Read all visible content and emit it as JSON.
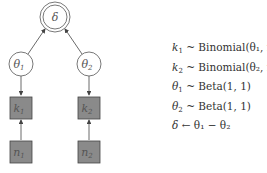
{
  "diagram": {
    "type": "graphical-model",
    "nodes": [
      {
        "id": "delta",
        "label": "δ",
        "sub": "",
        "shape": "double-circle",
        "kind": "deterministic"
      },
      {
        "id": "theta1",
        "label": "θ",
        "sub": "1",
        "shape": "circle",
        "kind": "latent"
      },
      {
        "id": "theta2",
        "label": "θ",
        "sub": "2",
        "shape": "circle",
        "kind": "latent"
      },
      {
        "id": "k1",
        "label": "k",
        "sub": "1",
        "shape": "square",
        "kind": "observed"
      },
      {
        "id": "k2",
        "label": "k",
        "sub": "2",
        "shape": "square",
        "kind": "observed"
      },
      {
        "id": "n1",
        "label": "n",
        "sub": "1",
        "shape": "square",
        "kind": "observed"
      },
      {
        "id": "n2",
        "label": "n",
        "sub": "2",
        "shape": "square",
        "kind": "observed"
      }
    ],
    "edges": [
      {
        "from": "theta1",
        "to": "delta"
      },
      {
        "from": "theta2",
        "to": "delta"
      },
      {
        "from": "theta1",
        "to": "k1"
      },
      {
        "from": "theta2",
        "to": "k2"
      },
      {
        "from": "n1",
        "to": "k1"
      },
      {
        "from": "n2",
        "to": "k2"
      }
    ],
    "colors": {
      "observed_fill": "#8a8a8a",
      "stroke": "#444444",
      "latent_fill": "#ffffff"
    }
  },
  "equations": [
    {
      "lhs": "k",
      "lhs_sub": "1",
      "op": "~",
      "rhs": "Binomial(θ₁, n₁)"
    },
    {
      "lhs": "k",
      "lhs_sub": "2",
      "op": "~",
      "rhs": "Binomial(θ₂, n₂)"
    },
    {
      "lhs": "θ",
      "lhs_sub": "1",
      "op": "~",
      "rhs": "Beta(1, 1)"
    },
    {
      "lhs": "θ",
      "lhs_sub": "2",
      "op": "~",
      "rhs": "Beta(1, 1)"
    },
    {
      "lhs": "δ",
      "lhs_sub": "",
      "op": "←",
      "rhs": "θ₁ − θ₂"
    }
  ]
}
